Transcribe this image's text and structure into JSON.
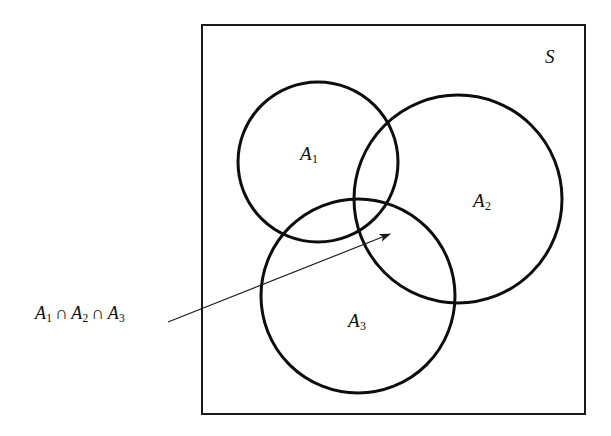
{
  "figure": {
    "type": "venn-diagram",
    "title": "",
    "background_color": "#ffffff",
    "stroke_color": "#0d0d0d"
  },
  "universe": {
    "label": "S",
    "shape": "rectangle",
    "x": 201,
    "y": 24,
    "width": 385,
    "height": 391,
    "stroke_width": 2
  },
  "sets": [
    {
      "key": "a1",
      "label": "A",
      "subscript": "1",
      "cx": 318,
      "cy": 162,
      "r": 80,
      "stroke_width": 3,
      "label_x": 300,
      "label_y": 143
    },
    {
      "key": "a2",
      "label": "A",
      "subscript": "2",
      "cx": 458,
      "cy": 199,
      "r": 104,
      "stroke_width": 3,
      "label_x": 473,
      "label_y": 190
    },
    {
      "key": "a3",
      "label": "A",
      "subscript": "3",
      "cx": 358,
      "cy": 296,
      "r": 97,
      "stroke_width": 3,
      "label_x": 348,
      "label_y": 310
    }
  ],
  "annotation": {
    "text_prefix": "A",
    "sub1": "1",
    "cap": "∩",
    "sub2": "2",
    "sub3": "3",
    "full_text": "A1 ∩ A2 ∩ A3",
    "arrow": {
      "x1": 168,
      "y1": 322,
      "x2": 393,
      "y2": 233,
      "stroke_width": 1.1,
      "head_length": 13,
      "head_width": 5
    }
  }
}
